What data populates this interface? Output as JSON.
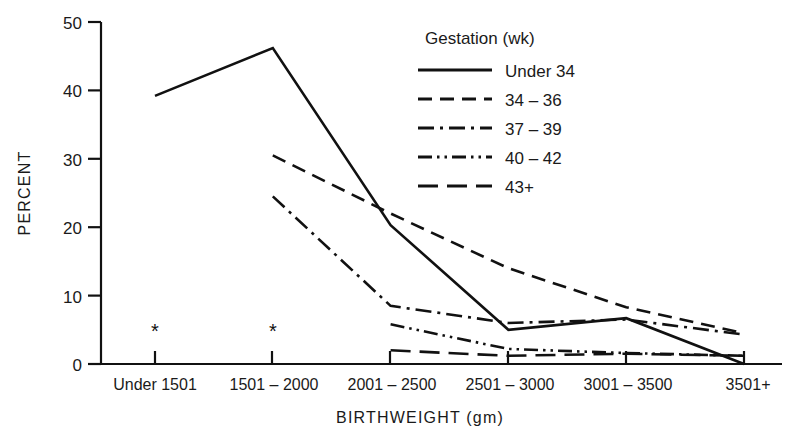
{
  "chart_data": {
    "type": "line",
    "title": "",
    "xlabel": "BIRTHWEIGHT (gm)",
    "ylabel": "PERCENT",
    "ylim": [
      0,
      50
    ],
    "yticks": [
      0,
      10,
      20,
      30,
      40,
      50
    ],
    "grid": false,
    "legend_position": "upper-right",
    "legend_title": "Gestation (wk)",
    "categories": [
      "Under 1501",
      "1501 – 2000",
      "2001 – 2500",
      "2501 – 3000",
      "3001 – 3500",
      "3501+"
    ],
    "annotations": [
      {
        "label": "*",
        "category": "Under 1501",
        "note": "missing-data-marker"
      },
      {
        "label": "*",
        "category": "1501 – 2000",
        "note": "missing-data-marker"
      }
    ],
    "series": [
      {
        "name": "Under 34",
        "style": "solid",
        "dasharray": "none",
        "values": [
          39.2,
          46.2,
          20.3,
          5.0,
          6.7,
          0.0
        ]
      },
      {
        "name": "34 – 36",
        "style": "dashed",
        "dasharray": "14,8",
        "values": [
          null,
          30.5,
          22.0,
          14.0,
          8.3,
          4.5
        ]
      },
      {
        "name": "37 – 39",
        "style": "dash-dot",
        "dasharray": "16,6,3,6",
        "values": [
          null,
          24.5,
          8.5,
          6.0,
          6.5,
          4.3
        ]
      },
      {
        "name": "40 – 42",
        "style": "dash-dot-dot",
        "dasharray": "14,5,2.5,5,2.5,5",
        "values": [
          null,
          null,
          5.8,
          2.2,
          1.6,
          1.2
        ]
      },
      {
        "name": "43+",
        "style": "long-dash",
        "dasharray": "20,9",
        "values": [
          null,
          null,
          2.0,
          1.2,
          1.5,
          1.2
        ]
      }
    ]
  },
  "axes": {
    "y_tick_labels": [
      "0",
      "10",
      "20",
      "30",
      "40",
      "50"
    ],
    "y_title": "PERCENT",
    "x_title": "BIRTHWEIGHT (gm)"
  },
  "legend": {
    "title": "Gestation (wk)",
    "items": [
      {
        "label": "Under 34"
      },
      {
        "label": "34 – 36"
      },
      {
        "label": "37 – 39"
      },
      {
        "label": "40 – 42"
      },
      {
        "label": "43+"
      }
    ]
  },
  "markers": {
    "asterisk": "*"
  }
}
